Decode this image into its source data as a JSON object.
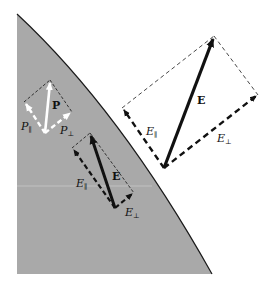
{
  "figure": {
    "colors": {
      "background": "#ffffff",
      "dielectric_fill": "#a9a9a9",
      "boundary": "#1a1a1a",
      "field_vector": "#111111",
      "polarization_vector": "#ffffff"
    }
  },
  "labels": {
    "P": "P",
    "P_parallel": "P",
    "P_parallel_sub": "∥",
    "P_perp": "P",
    "P_perp_sub": "⊥",
    "E_inside": "E",
    "E_inside_parallel": "E",
    "E_inside_parallel_sub": "∥",
    "E_inside_perp": "E",
    "E_inside_perp_sub": "⊥",
    "E_outside": "E",
    "E_outside_parallel": "E",
    "E_outside_parallel_sub": "∥",
    "E_outside_perp": "E",
    "E_outside_perp_sub": "⊥"
  }
}
